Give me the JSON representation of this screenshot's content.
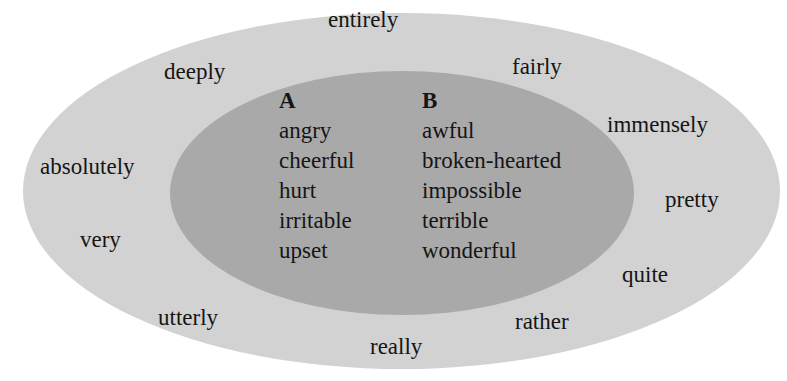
{
  "diagram": {
    "type": "nested-ellipses",
    "colors": {
      "outer_fill": "#d2d2d2",
      "inner_fill": "#a9a9a9",
      "text": "#151515"
    },
    "outer_words": [
      {
        "text": "entirely",
        "x": 328,
        "y": 8
      },
      {
        "text": "deeply",
        "x": 164,
        "y": 60
      },
      {
        "text": "fairly",
        "x": 512,
        "y": 55
      },
      {
        "text": "immensely",
        "x": 607,
        "y": 113
      },
      {
        "text": "absolutely",
        "x": 40,
        "y": 155
      },
      {
        "text": "pretty",
        "x": 665,
        "y": 188
      },
      {
        "text": "very",
        "x": 80,
        "y": 228
      },
      {
        "text": "quite",
        "x": 622,
        "y": 263
      },
      {
        "text": "utterly",
        "x": 158,
        "y": 306
      },
      {
        "text": "rather",
        "x": 515,
        "y": 310
      },
      {
        "text": "really",
        "x": 370,
        "y": 335
      }
    ],
    "columns": [
      {
        "heading": "A",
        "words": [
          "angry",
          "cheerful",
          "hurt",
          "irritable",
          "upset"
        ]
      },
      {
        "heading": "B",
        "words": [
          "awful",
          "broken-hearted",
          "impossible",
          "terrible",
          "wonderful"
        ]
      }
    ]
  }
}
